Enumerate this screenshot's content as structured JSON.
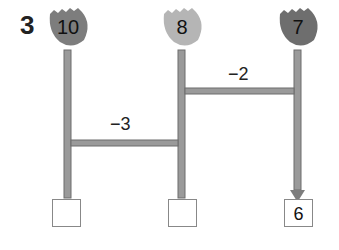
{
  "problem": {
    "number": "3"
  },
  "flowers": [
    {
      "value": "10",
      "color": "#7d7d7d"
    },
    {
      "value": "8",
      "color": "#b5b5b5"
    },
    {
      "value": "7",
      "color": "#6e6e6e"
    }
  ],
  "operations": [
    {
      "label": "−3"
    },
    {
      "label": "−2"
    }
  ],
  "answer_boxes": [
    {
      "value": ""
    },
    {
      "value": ""
    },
    {
      "value": "6"
    }
  ],
  "colors": {
    "pipe": "#9a9a9a",
    "pipe_edge": "#6d6d6d"
  }
}
